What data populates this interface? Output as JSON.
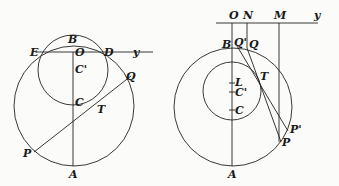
{
  "figures": [
    {
      "name": "left",
      "labels": {
        "B": "B",
        "E": "E",
        "O": "O",
        "D": "D",
        "y": "y",
        "Cp": "C'",
        "Q": "Q",
        "C": "C",
        "T": "T",
        "P": "P",
        "A": "A"
      }
    },
    {
      "name": "right",
      "labels": {
        "O": "O",
        "N": "N",
        "M": "M",
        "y": "y",
        "B": "B",
        "Qp": "Q'",
        "Q": "Q",
        "L": "L",
        "Cp": "C'",
        "C": "C",
        "T": "T",
        "Pp": "P'",
        "P": "P",
        "A": "A"
      }
    }
  ]
}
